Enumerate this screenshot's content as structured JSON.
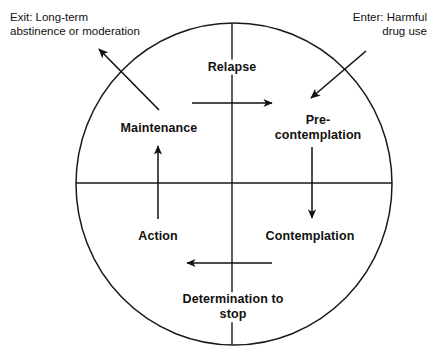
{
  "diagram": {
    "shape": "circle",
    "stroke_color": "#1a1a1a",
    "background_color": "#ffffff",
    "stages": [
      {
        "id": "relapse",
        "label": "Relapse",
        "position": "top"
      },
      {
        "id": "precontemplation",
        "label": "Pre-\ncontemplation",
        "line1": "Pre-",
        "line2": "contemplation",
        "position": "upper-right"
      },
      {
        "id": "contemplation",
        "label": "Contemplation",
        "position": "lower-right"
      },
      {
        "id": "determination",
        "label": "Determination to\nstop",
        "line1": "Determination to",
        "line2": "stop",
        "position": "bottom"
      },
      {
        "id": "action",
        "label": "Action",
        "position": "lower-left"
      },
      {
        "id": "maintenance",
        "label": "Maintenance",
        "position": "upper-left"
      }
    ],
    "annotations": [
      {
        "id": "enter",
        "line1": "Enter: Harmful",
        "line2": "drug use",
        "points_to": "precontemplation"
      },
      {
        "id": "exit",
        "line1": "Exit: Long-term",
        "line2": "abstinence or moderation",
        "points_from": "maintenance"
      }
    ],
    "flow_arrows": [
      {
        "id": "relapse-to-precontemplation",
        "direction": "right"
      },
      {
        "id": "precontemplation-to-contemplation",
        "direction": "down"
      },
      {
        "id": "contemplation-to-determination",
        "direction": "left"
      },
      {
        "id": "action-to-maintenance",
        "direction": "up"
      }
    ]
  }
}
